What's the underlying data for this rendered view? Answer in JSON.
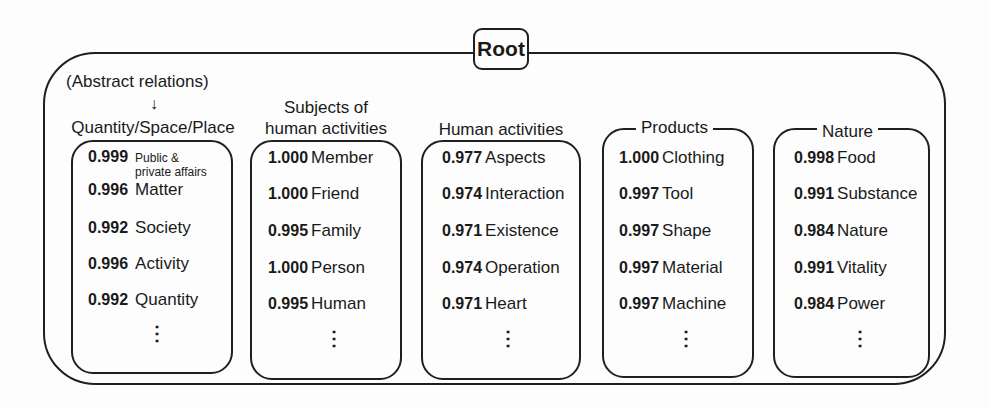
{
  "root": {
    "label": "Root"
  },
  "abstract_note": {
    "label": "(Abstract relations)",
    "arrow": "↓"
  },
  "columns": [
    {
      "title": "Quantity/Space/Place",
      "rows": [
        {
          "score": "0.999",
          "term": "Public &",
          "term2": "private affairs"
        },
        {
          "score": "0.996",
          "term": "Matter"
        },
        {
          "score": "0.992",
          "term": "Society"
        },
        {
          "score": "0.996",
          "term": "Activity"
        },
        {
          "score": "0.992",
          "term": "Quantity"
        }
      ],
      "ellipsis": "⋮"
    },
    {
      "title": "Subjects of",
      "title2": "human activities",
      "rows": [
        {
          "score": "1.000",
          "term": "Member"
        },
        {
          "score": "1.000",
          "term": "Friend"
        },
        {
          "score": "0.995",
          "term": "Family"
        },
        {
          "score": "1.000",
          "term": "Person"
        },
        {
          "score": "0.995",
          "term": "Human"
        }
      ],
      "ellipsis": "⋮"
    },
    {
      "title": "Human activities",
      "rows": [
        {
          "score": "0.977",
          "term": "Aspects"
        },
        {
          "score": "0.974",
          "term": "Interaction"
        },
        {
          "score": "0.971",
          "term": "Existence"
        },
        {
          "score": "0.974",
          "term": "Operation"
        },
        {
          "score": "0.971",
          "term": "Heart"
        }
      ],
      "ellipsis": "⋮"
    },
    {
      "title": "Products",
      "rows": [
        {
          "score": "1.000",
          "term": "Clothing"
        },
        {
          "score": "0.997",
          "term": "Tool"
        },
        {
          "score": "0.997",
          "term": "Shape"
        },
        {
          "score": "0.997",
          "term": "Material"
        },
        {
          "score": "0.997",
          "term": "Machine"
        }
      ],
      "ellipsis": "⋮"
    },
    {
      "title": "Nature",
      "rows": [
        {
          "score": "0.998",
          "term": "Food"
        },
        {
          "score": "0.991",
          "term": "Substance"
        },
        {
          "score": "0.984",
          "term": "Nature"
        },
        {
          "score": "0.991",
          "term": "Vitality"
        },
        {
          "score": "0.984",
          "term": "Power"
        }
      ],
      "ellipsis": "⋮"
    }
  ]
}
